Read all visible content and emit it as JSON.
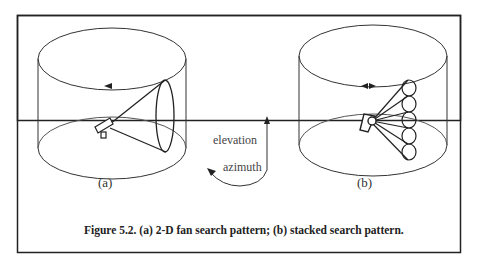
{
  "figure": {
    "number": "5.2",
    "caption": "Figure 5.2. (a) 2-D fan search pattern; (b) stacked search pattern.",
    "panels": [
      {
        "id": "a",
        "label": "(a)",
        "description": "2-D fan search pattern"
      },
      {
        "id": "b",
        "label": "(b)",
        "description": "stacked search pattern"
      }
    ],
    "axes": {
      "elevation_label": "elevation",
      "azimuth_label": "azimuth"
    },
    "colors": {
      "line": "#333333",
      "border": "#222222",
      "background": "#ffffff"
    }
  }
}
